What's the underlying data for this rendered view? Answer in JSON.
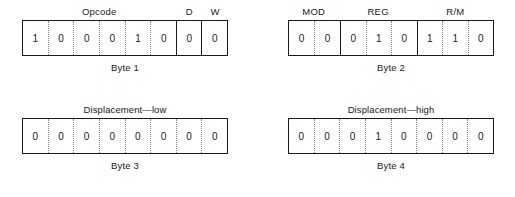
{
  "diagram": {
    "bytes": [
      {
        "caption": "Byte 1",
        "label_mode": "groups",
        "groups": [
          {
            "label": "Opcode",
            "bits": [
              "1",
              "0",
              "0",
              "0",
              "1",
              "0"
            ]
          },
          {
            "label": "D",
            "bits": [
              "0"
            ]
          },
          {
            "label": "W",
            "bits": [
              "0"
            ]
          }
        ]
      },
      {
        "caption": "Byte 2",
        "label_mode": "groups",
        "groups": [
          {
            "label": "MOD",
            "bits": [
              "0",
              "0"
            ]
          },
          {
            "label": "REG",
            "bits": [
              "0",
              "1",
              "0"
            ]
          },
          {
            "label": "R/M",
            "bits": [
              "1",
              "1",
              "0"
            ]
          }
        ]
      },
      {
        "caption": "Byte 3",
        "label_mode": "wide",
        "wide_label": "Displacement—low",
        "groups": [
          {
            "label": "",
            "bits": [
              "0",
              "0",
              "0",
              "0",
              "0",
              "0",
              "0",
              "0"
            ]
          }
        ]
      },
      {
        "caption": "Byte 4",
        "label_mode": "wide",
        "wide_label": "Displacement—high",
        "groups": [
          {
            "label": "",
            "bits": [
              "0",
              "0",
              "0",
              "1",
              "0",
              "0",
              "0",
              "0"
            ]
          }
        ]
      }
    ]
  }
}
